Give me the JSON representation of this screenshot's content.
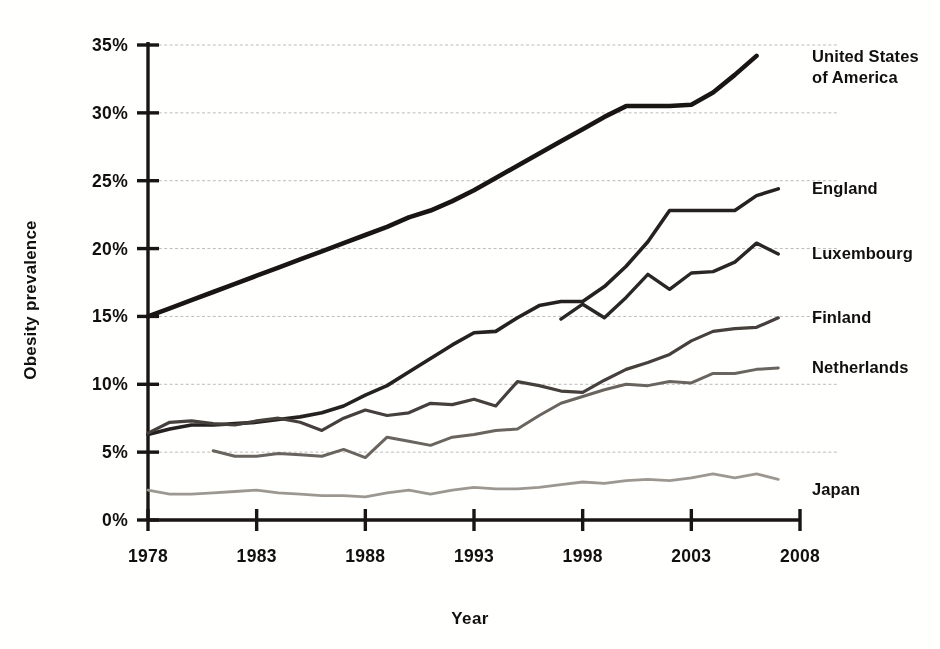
{
  "chart_data": {
    "type": "line",
    "title": "",
    "xlabel": "Year",
    "ylabel": "Obesity prevalence",
    "xlim": [
      1978,
      2008
    ],
    "ylim": [
      0,
      35
    ],
    "grid": true,
    "legend_position": "inline-right",
    "x_ticks": [
      "1978",
      "1983",
      "1988",
      "1993",
      "1998",
      "2003",
      "2008"
    ],
    "x_tick_values": [
      1978,
      1983,
      1988,
      1993,
      1998,
      2003,
      2008
    ],
    "y_ticks": [
      "0%",
      "5%",
      "10%",
      "15%",
      "20%",
      "25%",
      "30%",
      "35%"
    ],
    "y_tick_values": [
      0,
      5,
      10,
      15,
      20,
      25,
      30,
      35
    ],
    "series": [
      {
        "name": "United States of America",
        "label": "United States of America",
        "label_lines": [
          "United States",
          "of America"
        ],
        "color": "#1b1714",
        "width": 4.6,
        "x": [
          1978,
          1979,
          1980,
          1981,
          1982,
          1983,
          1984,
          1985,
          1986,
          1987,
          1988,
          1989,
          1990,
          1991,
          1992,
          1993,
          1994,
          1995,
          1996,
          1997,
          1998,
          1999,
          2000,
          2001,
          2002,
          2003,
          2004,
          2005,
          2006
        ],
        "values": [
          15.0,
          15.6,
          16.2,
          16.8,
          17.4,
          18.0,
          18.6,
          19.2,
          19.8,
          20.4,
          21.0,
          21.6,
          22.3,
          22.8,
          23.5,
          24.3,
          25.2,
          26.1,
          27.0,
          27.9,
          28.8,
          29.7,
          30.5,
          30.5,
          30.5,
          30.6,
          31.5,
          32.8,
          34.2
        ]
      },
      {
        "name": "England",
        "label": "England",
        "label_lines": [
          "England"
        ],
        "color": "#272320",
        "width": 3.6,
        "x": [
          1978,
          1979,
          1980,
          1981,
          1982,
          1983,
          1984,
          1985,
          1986,
          1987,
          1988,
          1989,
          1990,
          1991,
          1992,
          1993,
          1994,
          1995,
          1996,
          1997,
          1998,
          1999,
          2000,
          2001,
          2002,
          2003,
          2004,
          2005,
          2006,
          2007
        ],
        "values": [
          6.3,
          6.7,
          7.0,
          7.0,
          7.1,
          7.2,
          7.4,
          7.6,
          7.9,
          8.4,
          9.2,
          9.9,
          10.9,
          11.9,
          12.9,
          13.8,
          13.9,
          14.9,
          15.8,
          16.1,
          16.1,
          17.2,
          18.7,
          20.5,
          22.8,
          22.8,
          22.8,
          22.8,
          23.9,
          24.4
        ]
      },
      {
        "name": "Luxembourg",
        "label": "Luxembourg",
        "label_lines": [
          "Luxembourg"
        ],
        "color": "#2c2825",
        "width": 3.4,
        "x": [
          1997,
          1998,
          1999,
          2000,
          2001,
          2002,
          2003,
          2004,
          2005,
          2006,
          2007
        ],
        "values": [
          14.8,
          15.9,
          14.9,
          16.4,
          18.1,
          17.0,
          18.2,
          18.3,
          19.0,
          20.4,
          19.6
        ]
      },
      {
        "name": "Finland",
        "label": "Finland",
        "label_lines": [
          "Finland"
        ],
        "color": "#46413c",
        "width": 3.2,
        "x": [
          1978,
          1979,
          1980,
          1981,
          1982,
          1983,
          1984,
          1985,
          1986,
          1987,
          1988,
          1989,
          1990,
          1991,
          1992,
          1993,
          1994,
          1995,
          1996,
          1997,
          1998,
          1999,
          2000,
          2001,
          2002,
          2003,
          2004,
          2005,
          2006,
          2007
        ],
        "values": [
          6.4,
          7.2,
          7.3,
          7.1,
          7.0,
          7.3,
          7.5,
          7.2,
          6.6,
          7.5,
          8.1,
          7.7,
          7.9,
          8.6,
          8.5,
          8.9,
          8.4,
          10.2,
          9.9,
          9.5,
          9.4,
          10.3,
          11.1,
          11.6,
          12.2,
          13.2,
          13.9,
          14.1,
          14.2,
          14.9
        ]
      },
      {
        "name": "Netherlands",
        "label": "Netherlands",
        "label_lines": [
          "Netherlands"
        ],
        "color": "#6a655f",
        "width": 3.0,
        "x": [
          1981,
          1982,
          1983,
          1984,
          1985,
          1986,
          1987,
          1988,
          1989,
          1990,
          1991,
          1992,
          1993,
          1994,
          1995,
          1996,
          1997,
          1998,
          1999,
          2000,
          2001,
          2002,
          2003,
          2004,
          2005,
          2006,
          2007
        ],
        "values": [
          5.1,
          4.7,
          4.7,
          4.9,
          4.8,
          4.7,
          5.2,
          4.6,
          6.1,
          5.8,
          5.5,
          6.1,
          6.3,
          6.6,
          6.7,
          7.7,
          8.6,
          9.1,
          9.6,
          10.0,
          9.9,
          10.2,
          10.1,
          10.8,
          10.8,
          11.1,
          11.2
        ]
      },
      {
        "name": "Japan",
        "label": "Japan",
        "label_lines": [
          "Japan"
        ],
        "color": "#9c9791",
        "width": 2.8,
        "x": [
          1978,
          1979,
          1980,
          1981,
          1982,
          1983,
          1984,
          1985,
          1986,
          1987,
          1988,
          1989,
          1990,
          1991,
          1992,
          1993,
          1994,
          1995,
          1996,
          1997,
          1998,
          1999,
          2000,
          2001,
          2002,
          2003,
          2004,
          2005,
          2006,
          2007
        ],
        "values": [
          2.2,
          1.9,
          1.9,
          2.0,
          2.1,
          2.2,
          2.0,
          1.9,
          1.8,
          1.8,
          1.7,
          2.0,
          2.2,
          1.9,
          2.2,
          2.4,
          2.3,
          2.3,
          2.4,
          2.6,
          2.8,
          2.7,
          2.9,
          3.0,
          2.9,
          3.1,
          3.4,
          3.1,
          3.4,
          3.0
        ]
      }
    ]
  }
}
